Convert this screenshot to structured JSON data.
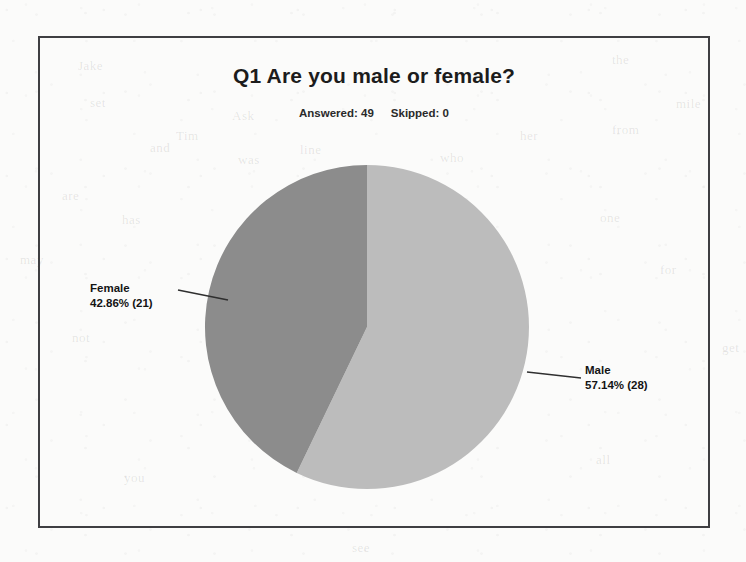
{
  "document": {
    "background_color": "#fbfbfa",
    "frame_border_color": "#3f3f42",
    "ghost_words": [
      "Jake",
      "the",
      "mile",
      "set",
      "Ask",
      "her",
      "from",
      "and",
      "Tim",
      "was",
      "line",
      "who",
      "are",
      "has",
      "one",
      "for",
      "not",
      "all",
      "you",
      "see",
      "may",
      "get",
      "out",
      "new",
      "our",
      "now"
    ]
  },
  "chart_data": {
    "type": "pie",
    "title": "Q1 Are you male or female?",
    "answered_label": "Answered: 49",
    "skipped_label": "Skipped: 0",
    "answered_count": 49,
    "skipped_count": 0,
    "categories": [
      "Male",
      "Female"
    ],
    "values": [
      28,
      21
    ],
    "percentages": [
      57.14,
      42.86
    ],
    "slices": [
      {
        "name": "Male",
        "label_name": "Male",
        "label_value": "57.14% (28)",
        "percent": 57.14,
        "count": 28,
        "color": "#bcbcbc",
        "start_angle_deg": 0,
        "end_angle_deg": 205.7
      },
      {
        "name": "Female",
        "label_name": "Female",
        "label_value": "42.86% (21)",
        "percent": 42.86,
        "count": 21,
        "color": "#8c8c8c",
        "start_angle_deg": 205.7,
        "end_angle_deg": 360
      }
    ],
    "legend": "none",
    "grid": false,
    "xlabel": "",
    "ylabel": ""
  }
}
